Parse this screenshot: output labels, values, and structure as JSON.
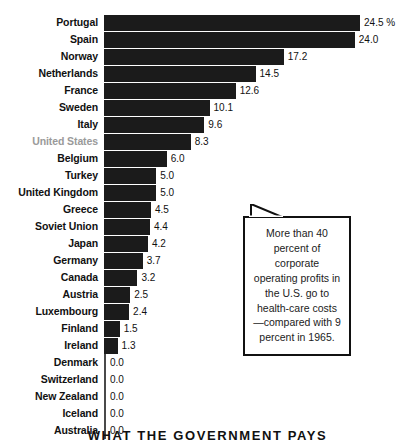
{
  "chart_data": {
    "type": "bar",
    "orientation": "horizontal",
    "title": "WHAT THE GOVERNMENT PAYS",
    "xlabel": "",
    "ylabel": "",
    "unit_suffix": "%",
    "xlim": [
      0,
      25
    ],
    "grid": false,
    "legend": null,
    "highlight_category": "United States",
    "categories": [
      "Portugal",
      "Spain",
      "Norway",
      "Netherlands",
      "France",
      "Sweden",
      "Italy",
      "United States",
      "Belgium",
      "Turkey",
      "United Kingdom",
      "Greece",
      "Soviet Union",
      "Japan",
      "Germany",
      "Canada",
      "Austria",
      "Luxembourg",
      "Finland",
      "Ireland",
      "Denmark",
      "Switzerland",
      "New Zealand",
      "Iceland",
      "Australia"
    ],
    "values": [
      24.5,
      24.0,
      17.2,
      14.5,
      12.6,
      10.1,
      9.6,
      8.3,
      6.0,
      5.0,
      5.0,
      4.5,
      4.4,
      4.2,
      3.7,
      3.2,
      2.5,
      2.4,
      1.5,
      1.3,
      0.0,
      0.0,
      0.0,
      0.0,
      0.0
    ],
    "value_labels": [
      "24.5 %",
      "24.0",
      "17.2",
      "14.5",
      "12.6",
      "10.1",
      "9.6",
      "8.3",
      "6.0",
      "5.0",
      "5.0",
      "4.5",
      "4.4",
      "4.2",
      "3.7",
      "3.2",
      "2.5",
      "2.4",
      "1.5",
      "1.3",
      "0.0",
      "0.0",
      "0.0",
      "0.0",
      "0.0"
    ]
  },
  "callout": {
    "text": "More than 40 percent of corporate operating profits in the U.S. go to health-care costs—compared with 9 percent in 1965."
  },
  "colors": {
    "bar": "#1b1b1b",
    "label": "#111111",
    "highlight_label": "#9a9a9a",
    "background": "#ffffff"
  }
}
